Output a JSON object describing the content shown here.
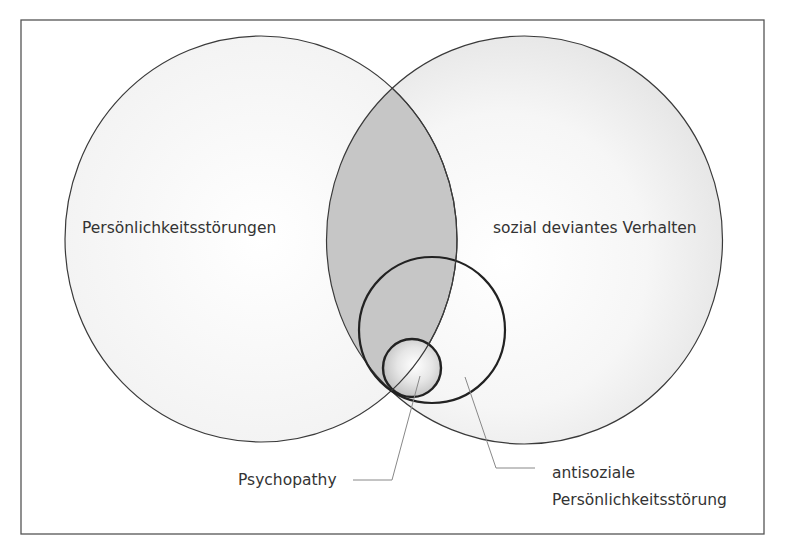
{
  "diagram": {
    "type": "venn",
    "sets": [
      {
        "id": "personality_disorders",
        "label": "Persönlichkeitsstörungen"
      },
      {
        "id": "socially_deviant",
        "label": "sozial deviantes Verhalten"
      },
      {
        "id": "antisocial_pd",
        "label_line1": "antisoziale",
        "label_line2": "Persönlichkeitsstörung"
      },
      {
        "id": "psychopathy",
        "label": "Psychopathy"
      }
    ],
    "colors": {
      "frame": "#555555",
      "outline": "#333333",
      "set_fill": "#f2f2f2",
      "overlap_fill": "#c4c4c4",
      "text": "#333333",
      "leader": "#888888"
    }
  }
}
